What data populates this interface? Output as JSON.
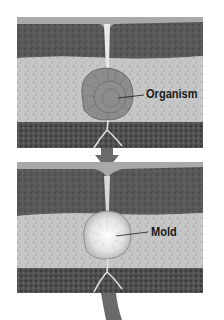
{
  "figure": {
    "type": "fossil-formation-diagram",
    "panels": [
      {
        "id": "panel-top",
        "label": "Organism",
        "layers": [
          "surface-strip",
          "dark-rock",
          "light-sediment",
          "dark-rock"
        ]
      },
      {
        "id": "panel-bottom",
        "label": "Mold",
        "layers": [
          "surface-strip",
          "dark-rock",
          "light-sediment",
          "dark-rock"
        ]
      }
    ],
    "arrow": "down-arrow-icon",
    "colors": {
      "dark_rock": "#5e5e5e",
      "light_sediment": "#c4c4c4",
      "surface_strip": "#a8a8a8",
      "organism": "#8a8a8a",
      "mold": "#e6e6e6",
      "arrow": "#6a6a6a"
    }
  }
}
